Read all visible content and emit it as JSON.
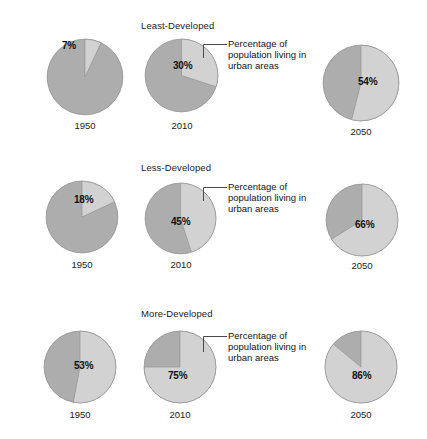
{
  "figure": {
    "background": "#ffffff",
    "urban_color": "#d2d2d2",
    "rural_color": "#adadad",
    "outline_color": "#8c8c8c"
  },
  "callout": {
    "line1": "Percentage of",
    "line2": "population living in",
    "line3": "urban areas"
  },
  "chart_data": {
    "type": "pie",
    "title": "",
    "subtitle": "",
    "xlabel": "",
    "ylabel": "",
    "legend_position": "callout-annotation",
    "annotations": [
      "Percentage of population living in urban areas"
    ],
    "slice_names": [
      "urban",
      "non-urban"
    ],
    "categories": [
      "1950",
      "2010",
      "2050"
    ],
    "groups": [
      {
        "name": "Least-Developed",
        "pies": [
          {
            "year": "1950",
            "value": 7,
            "label": "7%",
            "remainder": 93
          },
          {
            "year": "2010",
            "value": 30,
            "label": "30%",
            "remainder": 70
          },
          {
            "year": "2050",
            "value": 54,
            "label": "54%",
            "remainder": 46
          }
        ]
      },
      {
        "name": "Less-Developed",
        "pies": [
          {
            "year": "1950",
            "value": 18,
            "label": "18%",
            "remainder": 82
          },
          {
            "year": "2010",
            "value": 45,
            "label": "45%",
            "remainder": 55
          },
          {
            "year": "2050",
            "value": 66,
            "label": "66%",
            "remainder": 34
          }
        ]
      },
      {
        "name": "More-Developed",
        "pies": [
          {
            "year": "1950",
            "value": 53,
            "label": "53%",
            "remainder": 47
          },
          {
            "year": "2010",
            "value": 75,
            "label": "75%",
            "remainder": 25
          },
          {
            "year": "2050",
            "value": 86,
            "label": "86%",
            "remainder": 14
          }
        ]
      }
    ]
  }
}
